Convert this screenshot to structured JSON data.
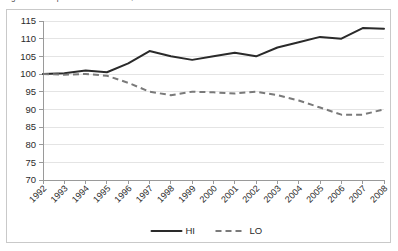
{
  "clipped_caption": "Figure  —  comparative index trend, HI and LO series",
  "chart_data": {
    "type": "line",
    "title": "",
    "xlabel": "",
    "ylabel": "",
    "categories": [
      "1992",
      "1993",
      "1994",
      "1995",
      "1996",
      "1997",
      "1998",
      "1999",
      "2000",
      "2001",
      "2002",
      "2003",
      "2004",
      "2005",
      "2006",
      "2007",
      "2008"
    ],
    "series": [
      {
        "name": "HI",
        "style": "solid",
        "color": "#2a2a2a",
        "values": [
          100.0,
          100.2,
          101.0,
          100.5,
          103.0,
          106.5,
          105.0,
          104.0,
          105.0,
          106.0,
          105.0,
          107.5,
          109.0,
          110.5,
          110.0,
          113.0,
          112.8
        ]
      },
      {
        "name": "LO",
        "style": "dashed",
        "color": "#7a7a7a",
        "values": [
          100.0,
          99.8,
          100.0,
          99.5,
          97.5,
          95.0,
          94.0,
          95.0,
          94.8,
          94.5,
          95.0,
          94.0,
          92.5,
          90.5,
          88.5,
          88.5,
          90.0
        ]
      }
    ],
    "ylim": [
      70,
      115
    ],
    "ytick_labels": [
      "115",
      "110",
      "105",
      "100",
      "95",
      "90",
      "85",
      "80",
      "75",
      "70"
    ],
    "ytick_values": [
      115,
      110,
      105,
      100,
      95,
      90,
      85,
      80,
      75,
      70
    ],
    "grid": true,
    "grid_axis": "y",
    "legend_position": "bottom",
    "legend": [
      {
        "label": "HI",
        "style": "solid"
      },
      {
        "label": "LO",
        "style": "dashed"
      }
    ],
    "xtick_rotation": 45
  }
}
